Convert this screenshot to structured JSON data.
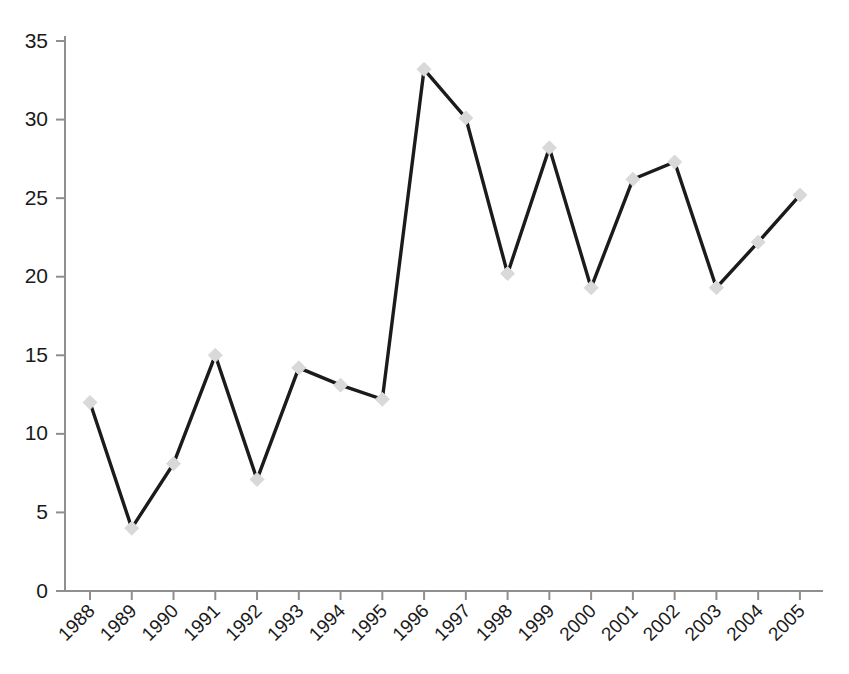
{
  "chart_data": {
    "type": "line",
    "title": "",
    "subtitle": "",
    "xlabel": "",
    "ylabel": "",
    "categories": [
      "1988",
      "1989",
      "1990",
      "1991",
      "1992",
      "1993",
      "1994",
      "1995",
      "1996",
      "1997",
      "1998",
      "1999",
      "2000",
      "2001",
      "2002",
      "2003",
      "2004",
      "2005"
    ],
    "values": [
      12.0,
      4.0,
      8.1,
      15.0,
      7.1,
      14.2,
      13.1,
      12.2,
      33.2,
      30.1,
      20.2,
      28.2,
      19.3,
      26.2,
      27.3,
      19.3,
      22.2,
      25.2
    ],
    "series": [
      {
        "name": "Series 1",
        "values": [
          12.0,
          4.0,
          8.1,
          15.0,
          7.1,
          14.2,
          13.1,
          12.2,
          33.2,
          30.1,
          20.2,
          28.2,
          19.3,
          26.2,
          27.3,
          19.3,
          22.2,
          25.2
        ]
      }
    ],
    "ylim": [
      0,
      35
    ],
    "yticks": [
      0,
      5,
      10,
      15,
      20,
      25,
      30,
      35
    ],
    "ytick_labels": [
      "0",
      "5",
      "10",
      "15",
      "20",
      "25",
      "30",
      "35"
    ],
    "xtick_labels": [
      "1988",
      "1989",
      "1990",
      "1991",
      "1992",
      "1993",
      "1994",
      "1995",
      "1996",
      "1997",
      "1998",
      "1999",
      "2000",
      "2001",
      "2002",
      "2003",
      "2004",
      "2005"
    ],
    "xtick_label_rotation_deg": 45,
    "grid": false,
    "legend": false,
    "legend_position": "none",
    "annotations": [],
    "colors": {
      "line": "#1b1b1b",
      "marker": "#d9d9d9",
      "axis": "#8f8f8f",
      "text": "#1a1a1a",
      "background": "#ffffff"
    },
    "marker_shape": "diamond"
  },
  "geometry": {
    "x_first_px": 90,
    "x_step_px": 41.76,
    "y_zero_px": 591,
    "y_per_unit_px": 15.714,
    "axis_top_px": 36,
    "axis_right_px": 823
  }
}
